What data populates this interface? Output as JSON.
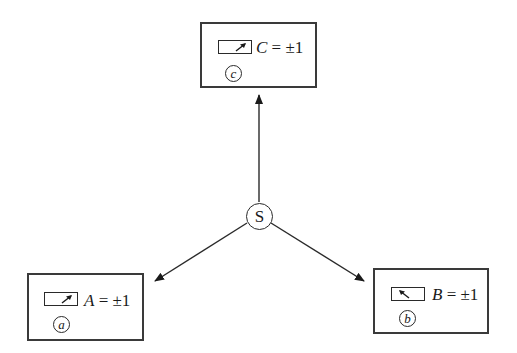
{
  "diagram": {
    "source": {
      "label": "S"
    },
    "stations": [
      {
        "id": "a",
        "tag": "a",
        "variable": "A",
        "equals": " = ±1",
        "pointer_direction": "up-right"
      },
      {
        "id": "b",
        "tag": "b",
        "variable": "B",
        "equals": " = ±1",
        "pointer_direction": "up-left"
      },
      {
        "id": "c",
        "tag": "c",
        "variable": "C",
        "equals": " = ±1",
        "pointer_direction": "up-right"
      }
    ],
    "edges": [
      {
        "from": "S",
        "to": "c",
        "icon": "arrow-up-icon"
      },
      {
        "from": "S",
        "to": "a",
        "icon": "arrow-down-left-icon"
      },
      {
        "from": "S",
        "to": "b",
        "icon": "arrow-down-right-icon"
      }
    ],
    "colors": {
      "stroke": "#2a2a2a",
      "background": "#ffffff"
    }
  }
}
